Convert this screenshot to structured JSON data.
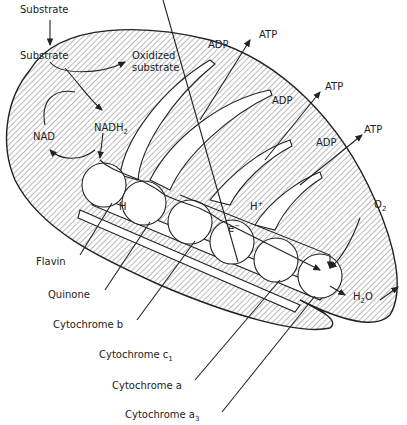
{
  "diagram": {
    "colors": {
      "ink": "#222222",
      "background": "#ffffff",
      "hatch": "#444444"
    },
    "labels": {
      "substrate_outside": "Substrate",
      "substrate_inside": "Substrate",
      "oxidized_line1": "Oxidized",
      "oxidized_line2": "substrate",
      "nad": "NAD",
      "nadh2": "NADH",
      "nadh2_sub": "2",
      "adp1": "ADP",
      "atp1": "ATP",
      "adp2": "ADP",
      "atp2": "ATP",
      "adp3": "ADP",
      "atp3": "ATP",
      "h": "H",
      "h_plus": "H",
      "h_plus_sup": "+",
      "e_minus": "e",
      "e_minus_sup": "−",
      "o2": "O",
      "o2_sub": "2",
      "h2o_h": "H",
      "h2o_sub": "2",
      "h2o_o": "O"
    },
    "components": [
      {
        "name": "Flavin"
      },
      {
        "name": "Quinone"
      },
      {
        "name": "Cytochrome b"
      },
      {
        "name": "Cytochrome c",
        "sub": "1"
      },
      {
        "name": "Cytochrome a"
      },
      {
        "name": "Cytochrome a",
        "sub": "3"
      }
    ]
  }
}
